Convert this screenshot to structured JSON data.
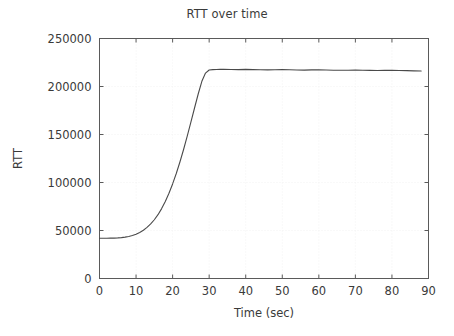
{
  "chart_data": {
    "type": "line",
    "title": "RTT over time",
    "xlabel": "Time (sec)",
    "ylabel": "RTT",
    "xlim": [
      0,
      90
    ],
    "ylim": [
      0,
      250000
    ],
    "grid": true,
    "legend": "none",
    "xticks": [
      0,
      10,
      20,
      30,
      40,
      50,
      60,
      70,
      80,
      90
    ],
    "xtick_labels": [
      "0",
      "10",
      "20",
      "30",
      "40",
      "50",
      "60",
      "70",
      "80",
      "90"
    ],
    "yticks": [
      0,
      50000,
      100000,
      150000,
      200000,
      250000
    ],
    "ytick_labels": [
      "0",
      "50000",
      "100000",
      "150000",
      "200000",
      "250000"
    ],
    "series": [
      {
        "name": "RTT",
        "color": "#4a4a4a",
        "x": [
          0,
          1,
          2,
          3,
          4,
          5,
          6,
          7,
          8,
          9,
          10,
          11,
          12,
          13,
          14,
          15,
          16,
          17,
          18,
          19,
          20,
          21,
          22,
          23,
          24,
          25,
          26,
          27,
          28,
          29,
          30,
          31,
          32,
          33,
          34,
          36,
          38,
          40,
          42,
          44,
          46,
          48,
          50,
          52,
          54,
          56,
          58,
          60,
          62,
          64,
          66,
          68,
          70,
          72,
          74,
          76,
          78,
          80,
          82,
          84,
          86,
          88
        ],
        "y": [
          42000,
          42000,
          42000,
          42050,
          42100,
          42300,
          42600,
          43100,
          43800,
          44800,
          46200,
          48000,
          50300,
          53200,
          56800,
          61200,
          66500,
          72800,
          80200,
          88800,
          98500,
          109400,
          121400,
          134400,
          148300,
          162800,
          177600,
          192200,
          205400,
          214000,
          217200,
          217600,
          217700,
          217800,
          217800,
          217700,
          217600,
          217800,
          217600,
          217400,
          217300,
          217500,
          217600,
          217400,
          217200,
          217100,
          217300,
          217400,
          217200,
          217000,
          216900,
          217000,
          217100,
          216900,
          216800,
          216700,
          216800,
          216900,
          216700,
          216500,
          216300,
          216200
        ]
      }
    ]
  },
  "axes": {
    "title_text": "RTT over time",
    "x_axis_title": "Time (sec)",
    "y_axis_title": "RTT"
  },
  "colors": {
    "series": "#4a4a4a",
    "axis": "#5a5a5a",
    "grid": "#f0f0f0",
    "text": "#3a3a3a",
    "background": "#ffffff"
  }
}
